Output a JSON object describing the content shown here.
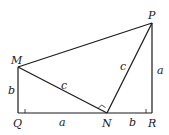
{
  "diagram": {
    "type": "geometry",
    "points": {
      "P": {
        "label": "P",
        "x": 152,
        "y": 23
      },
      "M": {
        "label": "M",
        "x": 18,
        "y": 67
      },
      "Q": {
        "label": "Q",
        "x": 18,
        "y": 113
      },
      "N": {
        "label": "N",
        "x": 107,
        "y": 113
      },
      "R": {
        "label": "R",
        "x": 152,
        "y": 113
      }
    },
    "segment_labels": {
      "MQ": "b",
      "QN": "a",
      "NR": "b",
      "RP": "a",
      "MN": "c",
      "NP": "c"
    },
    "colors": {
      "stroke": "#1a1a1a",
      "background": "#ffffff"
    }
  }
}
